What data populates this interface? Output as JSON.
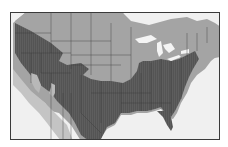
{
  "map": {
    "region": "United States (contiguous) and northern Mexico",
    "legend": [],
    "colors": {
      "background_water": "#f0f0f0",
      "land_outside_range": "#a4a4a4",
      "range_area": "#5e5e5e",
      "borders": "#3a3a3a",
      "lakes": "#f4f4f4",
      "fringe": "#c4c4c4"
    }
  }
}
